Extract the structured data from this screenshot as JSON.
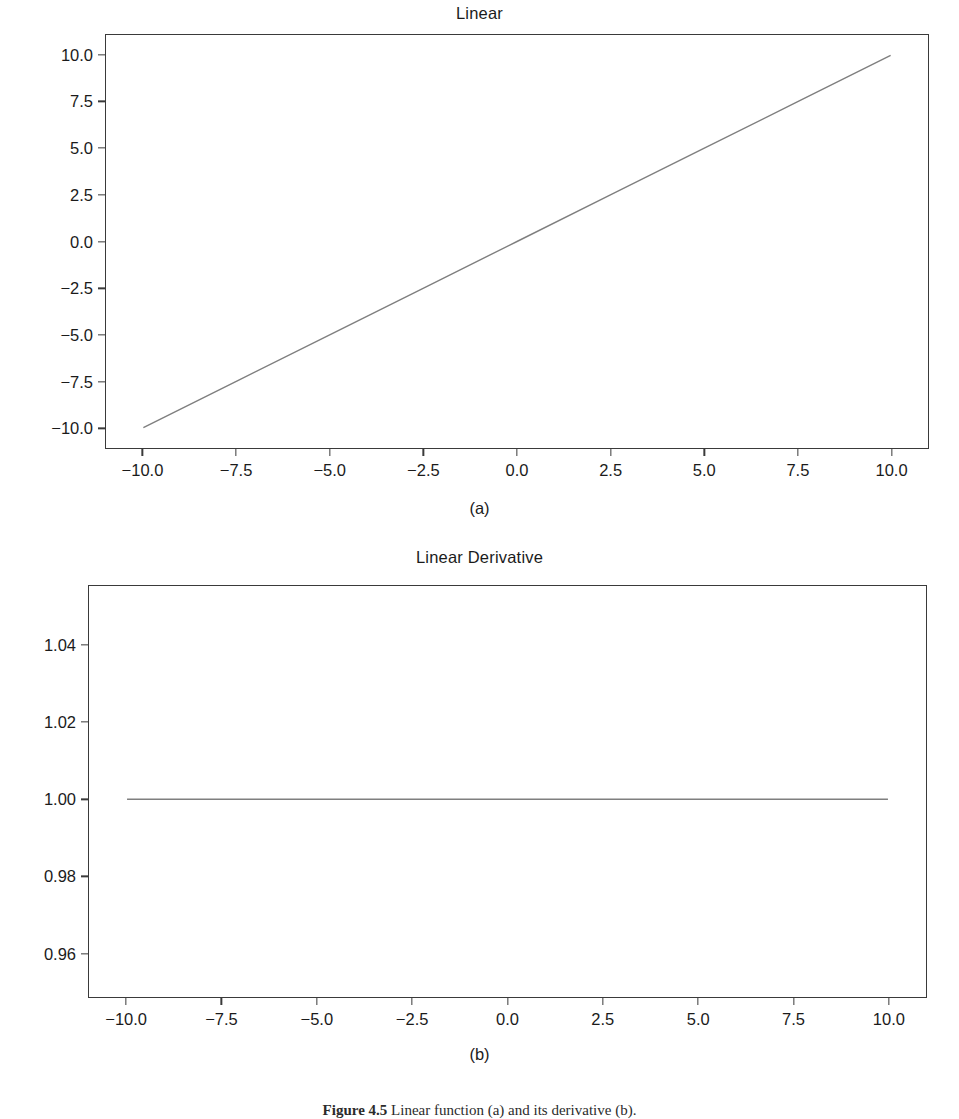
{
  "figure": {
    "caption_number": "Figure 4.5",
    "caption_text": "Linear function (a) and its derivative (b)."
  },
  "panels": [
    {
      "title": "Linear",
      "subcaption": "(a)"
    },
    {
      "title": "Linear Derivative",
      "subcaption": "(b)"
    }
  ],
  "chart_data": [
    {
      "type": "line",
      "title": "Linear",
      "subcaption": "(a)",
      "xlabel": "",
      "ylabel": "",
      "xlim": [
        -11.0,
        11.0
      ],
      "ylim": [
        -11.1,
        11.1
      ],
      "xticks": [
        -10.0,
        -7.5,
        -5.0,
        -2.5,
        0.0,
        2.5,
        5.0,
        7.5,
        10.0
      ],
      "xticklabels": [
        "−10.0",
        "−7.5",
        "−5.0",
        "−2.5",
        "0.0",
        "2.5",
        "5.0",
        "7.5",
        "10.0"
      ],
      "yticks": [
        10.0,
        7.5,
        5.0,
        2.5,
        0.0,
        -2.5,
        -5.0,
        -7.5,
        -10.0
      ],
      "yticklabels": [
        "10.0",
        "7.5",
        "5.0",
        "2.5",
        "0.0",
        "−2.5",
        "−5.0",
        "−7.5",
        "−10.0"
      ],
      "grid": false,
      "legend": false,
      "line_color": "#7f7f7f",
      "line_width": 1.2,
      "series": [
        {
          "name": "f(x) = x",
          "x": [
            -10.0,
            -7.5,
            -5.0,
            -2.5,
            0.0,
            2.5,
            5.0,
            7.5,
            10.0
          ],
          "values": [
            -10.0,
            -7.5,
            -5.0,
            -2.5,
            0.0,
            2.5,
            5.0,
            7.5,
            10.0
          ]
        }
      ]
    },
    {
      "type": "line",
      "title": "Linear Derivative",
      "subcaption": "(b)",
      "xlabel": "",
      "ylabel": "",
      "xlim": [
        -11.0,
        11.0
      ],
      "ylim": [
        0.9485,
        1.0555
      ],
      "xticks": [
        -10.0,
        -7.5,
        -5.0,
        -2.5,
        0.0,
        2.5,
        5.0,
        7.5,
        10.0
      ],
      "xticklabels": [
        "−10.0",
        "−7.5",
        "−5.0",
        "−2.5",
        "0.0",
        "2.5",
        "5.0",
        "7.5",
        "10.0"
      ],
      "yticks": [
        1.04,
        1.02,
        1.0,
        0.98,
        0.96
      ],
      "yticklabels": [
        "1.04",
        "1.02",
        "1.00",
        "0.98",
        "0.96"
      ],
      "grid": false,
      "legend": false,
      "line_color": "#7f7f7f",
      "line_width": 1.2,
      "series": [
        {
          "name": "f'(x) = 1",
          "x": [
            -10.0,
            -7.5,
            -5.0,
            -2.5,
            0.0,
            2.5,
            5.0,
            7.5,
            10.0
          ],
          "values": [
            1.0,
            1.0,
            1.0,
            1.0,
            1.0,
            1.0,
            1.0,
            1.0,
            1.0
          ]
        }
      ]
    }
  ]
}
